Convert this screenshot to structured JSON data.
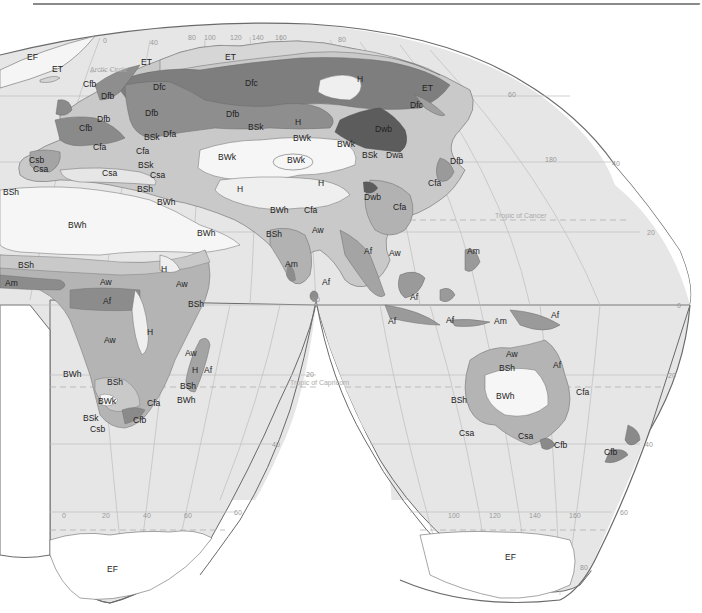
{
  "map": {
    "title": "",
    "projection": "interrupted-homolosine",
    "colors": {
      "ocean": "#e8e8e8",
      "A": "#a9a9a9",
      "Af": "#8c8c8c",
      "Aw": "#b4b4b4",
      "B_desert": "#f7f7f7",
      "B_steppe": "#c8c8c8",
      "C": "#b0b0b0",
      "Cfb": "#8a8a8a",
      "D": "#7a7a7a",
      "Dwb": "#5e5e5e",
      "E": "#d4d4d4",
      "H": "#efefef",
      "grid": "#b8b8b8",
      "outline": "#6a6a6a"
    },
    "reference_lines": {
      "arctic_circle": "Arctic Circle",
      "tropic_of_cancer": "Tropic of Cancer",
      "tropic_of_capricorn": "Tropic of Capricorn"
    },
    "longitude_labels_top": [
      "0",
      "40",
      "80",
      "100",
      "120",
      "140",
      "160"
    ],
    "latitude_labels_right": [
      "80",
      "60",
      "40",
      "20",
      "0",
      "20",
      "40",
      "60",
      "80"
    ],
    "longitude_labels_bottom_left": [
      "0",
      "20",
      "40",
      "60"
    ],
    "longitude_labels_bottom_right": [
      "100",
      "120",
      "140",
      "160"
    ],
    "misc_labels": {
      "lon_180": "180",
      "lat_80_africa": "80",
      "lat_20_africa": "20",
      "lat_40_africa": "40",
      "lat_60_africa": "60"
    },
    "regions": {
      "europe": [
        "EF",
        "ET",
        "ET",
        "Cfb",
        "Dfb",
        "Dfc",
        "Dfb",
        "Cfb",
        "Cfa",
        "BSk",
        "Dfa",
        "Cfa",
        "Csb",
        "Csa",
        "Csa",
        "BSk",
        "Csa",
        "BSh",
        "BSh"
      ],
      "asia": [
        "ET",
        "Dfc",
        "Dfb",
        "BSk",
        "H",
        "BWk",
        "BWk",
        "BWk",
        "BWk",
        "H",
        "Dfc",
        "ET",
        "Dwb",
        "BSk",
        "Dwa",
        "Dfb",
        "Cfa",
        "H",
        "H",
        "BWh",
        "Cfa",
        "Dwb",
        "Cfa",
        "Aw",
        "BSh",
        "Am",
        "Af",
        "Af",
        "Aw",
        "Dfb"
      ],
      "africa": [
        "BWh",
        "BWh",
        "BWh",
        "BSh",
        "Am",
        "Aw",
        "Af",
        "H",
        "Aw",
        "BSh",
        "Aw",
        "H",
        "BWh",
        "BSh",
        "BWk",
        "Cfa",
        "BSk",
        "Csb",
        "Cfb",
        "Aw",
        "H",
        "Af",
        "BSh",
        "BWh"
      ],
      "oceania": [
        "Am",
        "Af",
        "Af",
        "Af",
        "Am",
        "Af",
        "Aw",
        "BSh",
        "Af",
        "BWh",
        "Cfa",
        "BSh",
        "Csa",
        "Csa",
        "Cfb",
        "Cfb"
      ],
      "antarctica": [
        "EF",
        "EF"
      ]
    }
  }
}
